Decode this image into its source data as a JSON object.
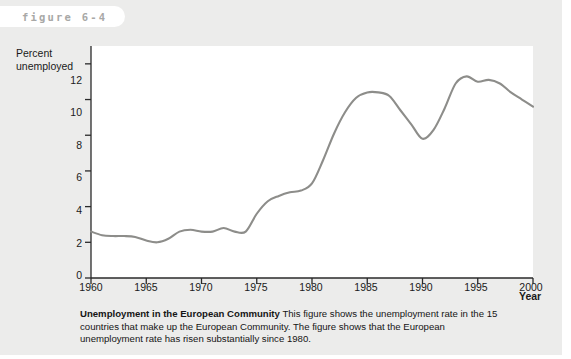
{
  "figure": {
    "tab_label": "figure 6-4"
  },
  "caption": {
    "title": "Unemployment in the European Community",
    "body": "This figure shows the unemployment rate in the 15 countries that make up the European Community. The figure shows that the European unemployment rate has risen substantially since 1980."
  },
  "chart_data": {
    "type": "line",
    "title": "Unemployment in the European Community",
    "xlabel": "Year",
    "ylabel": "Percent unemployed",
    "xlim": [
      1960,
      2000
    ],
    "ylim": [
      0,
      13
    ],
    "xticks": [
      1960,
      1965,
      1970,
      1975,
      1980,
      1985,
      1990,
      1995,
      2000
    ],
    "yticks": [
      0,
      2,
      4,
      6,
      8,
      10,
      12
    ],
    "grid": false,
    "legend": "none",
    "line_color": "#8d8d8a",
    "series": [
      {
        "name": "Percent unemployed",
        "x": [
          1960,
          1961,
          1962,
          1963,
          1964,
          1965,
          1966,
          1967,
          1968,
          1969,
          1970,
          1971,
          1972,
          1973,
          1974,
          1975,
          1976,
          1977,
          1978,
          1979,
          1980,
          1981,
          1982,
          1983,
          1984,
          1985,
          1986,
          1987,
          1988,
          1989,
          1990,
          1991,
          1992,
          1993,
          1994,
          1995,
          1996,
          1997,
          1998,
          1999,
          2000
        ],
        "values": [
          2.6,
          2.4,
          2.35,
          2.35,
          2.3,
          2.1,
          2.0,
          2.2,
          2.6,
          2.7,
          2.6,
          2.6,
          2.8,
          2.6,
          2.6,
          3.6,
          4.3,
          4.6,
          4.8,
          4.9,
          5.3,
          6.6,
          8.1,
          9.3,
          10.1,
          10.4,
          10.4,
          10.2,
          9.4,
          8.6,
          7.8,
          8.3,
          9.5,
          10.9,
          11.3,
          11.0,
          11.1,
          10.9,
          10.4,
          10.0,
          9.6
        ]
      }
    ]
  }
}
